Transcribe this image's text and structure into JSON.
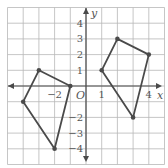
{
  "diagram": {
    "type": "coordinate-grid",
    "x_range": [
      -5,
      5
    ],
    "y_range": [
      -5,
      5
    ],
    "axis_labels": {
      "x": "x",
      "y": "y",
      "origin": "O"
    },
    "x_tick_labels": [
      {
        "value": -2,
        "label": "−2"
      },
      {
        "value": 1,
        "label": "1"
      },
      {
        "value": 4,
        "label": "4"
      }
    ],
    "y_tick_labels": [
      {
        "value": 4,
        "label": "4"
      },
      {
        "value": 3,
        "label": "3"
      },
      {
        "value": 2,
        "label": "2"
      },
      {
        "value": 1,
        "label": "1"
      },
      {
        "value": -2,
        "label": "−2"
      },
      {
        "value": -3,
        "label": "−3"
      },
      {
        "value": -4,
        "label": "−4"
      }
    ],
    "shapes": [
      {
        "name": "left-quadrilateral",
        "vertices": [
          [
            -3,
            1
          ],
          [
            -1,
            0
          ],
          [
            -2,
            -4
          ],
          [
            -4,
            -1
          ]
        ]
      },
      {
        "name": "right-quadrilateral",
        "vertices": [
          [
            1,
            1
          ],
          [
            2,
            3
          ],
          [
            4,
            2
          ],
          [
            3,
            -2
          ]
        ]
      }
    ],
    "colors": {
      "grid": "#b8b8b8",
      "axis": "#4a4a4a",
      "shape": "#4a4a4a",
      "label": "#555555"
    }
  }
}
